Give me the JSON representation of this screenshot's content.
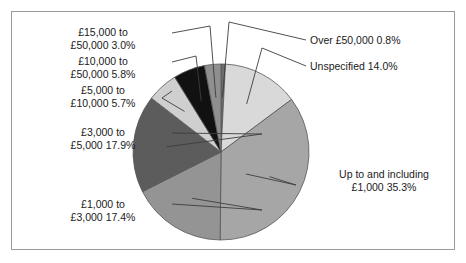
{
  "figure": {
    "background_color": "#ffffff",
    "border_color": "#9a9a9a",
    "leader_line_color": "#3d3d3d"
  },
  "chart_data": {
    "type": "pie",
    "title": "",
    "subtitle": "",
    "xlabel": "",
    "ylabel": "",
    "legend_position": "none",
    "grid": false,
    "labels_show_percent": true,
    "start_angle_deg": 0,
    "direction": "clockwise",
    "center": {
      "x": 221,
      "y": 152
    },
    "radius": 88,
    "categories": [
      "Over £50,000",
      "Unspecified",
      "Up to and including £1,000",
      "£1,000 to £3,000",
      "£3,000 to £5,000",
      "£5,000 to £10,000",
      "£10,000 to £50,000",
      "£15,000 to £50,000"
    ],
    "values": [
      0.8,
      14.0,
      35.3,
      17.4,
      17.9,
      5.7,
      5.8,
      3.0
    ],
    "colors": [
      "#6e6e6e",
      "#d9d9d9",
      "#a6a6a6",
      "#949494",
      "#5c5c5c",
      "#cfcfcf",
      "#111111",
      "#8f8f8f"
    ],
    "slice_edge_color": "#555555",
    "units": "percent"
  },
  "labels": {
    "over_50000": {
      "line1": "Over £50,000 0.8%",
      "text": "Over £50,000 0.8%"
    },
    "unspecified": {
      "line1": "Unspecified 14.0%",
      "text": "Unspecified 14.0%"
    },
    "up_to_1000": {
      "line1": "Up to and including",
      "line2": "£1,000 35.3%",
      "text": "Up to and including\n£1,000 35.3%"
    },
    "from_1000_to_3000": {
      "line1": "£1,000 to",
      "line2": "£3,000 17.4%",
      "text": "£1,000 to\n£3,000 17.4%"
    },
    "from_3000_to_5000": {
      "line1": "£3,000 to",
      "line2": "£5,000 17.9%",
      "text": "£3,000 to\n£5,000 17.9%"
    },
    "from_5000_to_10000": {
      "line1": "£5,000 to",
      "line2": "£10,000 5.7%",
      "text": "£5,000 to\n£10,000 5.7%"
    },
    "from_10000_to_50000": {
      "line1": "£10,000 to",
      "line2": "£50,000 5.8%",
      "text": "£10,000 to\n£50,000 5.8%"
    },
    "from_15000_to_50000": {
      "line1": "£15,000 to",
      "line2": "£50,000 3.0%",
      "text": "£15,000 to\n£50,000 3.0%"
    }
  }
}
